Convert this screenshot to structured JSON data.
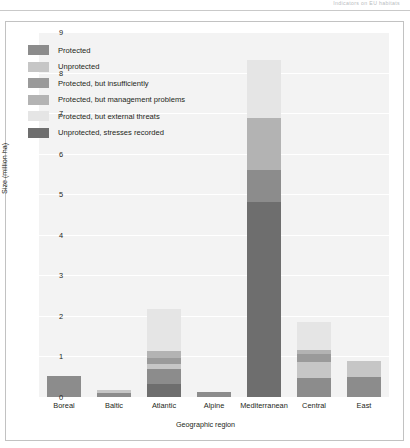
{
  "header": {
    "text": "Indicators on EU habitats"
  },
  "chart_data": {
    "type": "bar",
    "subtype": "stacked-bar",
    "title": "",
    "xlabel": "Geographic region",
    "ylabel": "Size (million ha)",
    "ylim": [
      0,
      9
    ],
    "yticks": [
      "0",
      "1",
      "2",
      "3",
      "4",
      "5",
      "6",
      "7",
      "8",
      "9"
    ],
    "grid": true,
    "grid_axis": "y",
    "legend_position": "upper-left-inside",
    "categories": [
      "Boreal",
      "Baltic",
      "Atlantic",
      "Alpine",
      "Mediterranean",
      "Central",
      "East"
    ],
    "series": [
      {
        "name": "Protected",
        "color": "#8c8c8c",
        "values": [
          0.52,
          0.1,
          0.35,
          0.12,
          0.78,
          0.46,
          0.5
        ]
      },
      {
        "name": "Unprotected",
        "color": "#c6c6c6",
        "values": [
          0.0,
          0.08,
          0.13,
          0.0,
          0.0,
          0.4,
          0.4
        ]
      },
      {
        "name": "Protected, but insufficiently",
        "color": "#9a9a9a",
        "values": [
          0.0,
          0.0,
          0.15,
          0.0,
          0.0,
          0.19,
          0.0
        ]
      },
      {
        "name": "Protected, but management problems",
        "color": "#b3b3b3",
        "values": [
          0.0,
          0.0,
          0.17,
          0.0,
          1.28,
          0.1,
          0.0
        ]
      },
      {
        "name": "Protected, but external threats",
        "color": "#e5e5e5",
        "values": [
          0.0,
          0.0,
          1.05,
          0.0,
          1.42,
          0.7,
          0.0
        ]
      },
      {
        "name": "Unprotected, stresses recorded",
        "color": "#6e6e6e",
        "values": [
          0.0,
          0.0,
          0.33,
          0.0,
          4.82,
          0.0,
          0.0
        ]
      }
    ],
    "stack_order": [
      "Unprotected, stresses recorded",
      "Protected",
      "Unprotected",
      "Protected, but insufficiently",
      "Protected, but management problems",
      "Protected, but external threats"
    ],
    "bar_totals": [
      0.52,
      0.18,
      2.18,
      0.12,
      8.3,
      1.85,
      0.9
    ]
  }
}
